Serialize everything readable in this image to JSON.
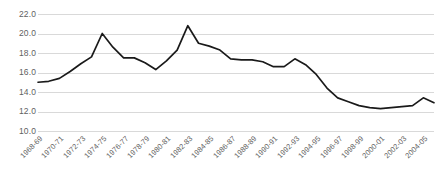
{
  "chart_data": {
    "type": "line",
    "title": "",
    "subtitle": "",
    "xlabel": "",
    "ylabel": "",
    "ylim": [
      10.0,
      22.0
    ],
    "ytick_step": 2.0,
    "yticks": [
      "22.0",
      "20.0",
      "18.0",
      "16.0",
      "14.0",
      "12.0",
      "10.0"
    ],
    "ytick_values": [
      22.0,
      20.0,
      18.0,
      16.0,
      14.0,
      12.0,
      10.0
    ],
    "grid": "horizontal",
    "legend": "none",
    "line_color": "#1a1a1a",
    "grid_color": "#d9d9d9",
    "tick_label_color": "#5f5f5f",
    "background_color": "#ffffff",
    "categories": [
      "1968-69",
      "1969-70",
      "1970-71",
      "1971-72",
      "1972-73",
      "1973-74",
      "1974-75",
      "1975-76",
      "1976-77",
      "1977-78",
      "1978-79",
      "1979-80",
      "1980-81",
      "1981-82",
      "1982-83",
      "1983-84",
      "1984-85",
      "1985-86",
      "1986-87",
      "1987-88",
      "1988-89",
      "1989-90",
      "1990-91",
      "1991-92",
      "1992-93",
      "1993-94",
      "1994-95",
      "1995-96",
      "1996-97",
      "1997-98",
      "1998-99",
      "1999-00",
      "2000-01",
      "2001-02",
      "2002-03",
      "2003-04",
      "2004-05",
      "2005-06"
    ],
    "xtick_labels": [
      "1968-69",
      "1970-71",
      "1972-73",
      "1974-75",
      "1976-77",
      "1978-79",
      "1980-81",
      "1982-83",
      "1984-85",
      "1986-87",
      "1988-89",
      "1990-91",
      "1992-93",
      "1994-95",
      "1996-97",
      "1998-99",
      "2000-01",
      "2002-03",
      "2004-05"
    ],
    "xtick_indices": [
      0,
      2,
      4,
      6,
      8,
      10,
      12,
      14,
      16,
      18,
      20,
      22,
      24,
      26,
      28,
      30,
      32,
      34,
      36
    ],
    "values": [
      15.0,
      15.1,
      15.4,
      16.1,
      16.9,
      17.6,
      20.0,
      18.6,
      17.5,
      17.5,
      17.0,
      16.3,
      17.2,
      18.3,
      20.8,
      19.0,
      18.7,
      18.3,
      17.4,
      17.3,
      17.3,
      17.1,
      16.6,
      16.6,
      17.4,
      16.8,
      15.8,
      14.4,
      13.4,
      13.0,
      12.6,
      12.4,
      12.3,
      12.4,
      12.5,
      12.6,
      13.4,
      12.9
    ],
    "annotations": []
  }
}
